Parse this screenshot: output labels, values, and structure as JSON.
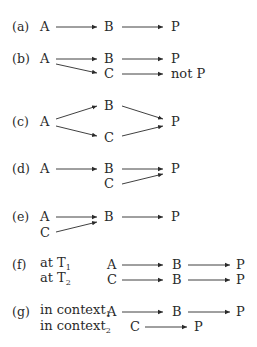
{
  "diagram": {
    "rows": [
      {
        "label": "(a)",
        "nodes": {
          "A": "A",
          "B": "B",
          "P": "P"
        }
      },
      {
        "label": "(b)",
        "nodes": {
          "A": "A",
          "B": "B",
          "P": "P",
          "C": "C",
          "notP": "not P"
        }
      },
      {
        "label": "(c)",
        "nodes": {
          "A": "A",
          "B": "B",
          "C": "C",
          "P": "P"
        }
      },
      {
        "label": "(d)",
        "nodes": {
          "A": "A",
          "B": "B",
          "C": "C",
          "P": "P"
        }
      },
      {
        "label": "(e)",
        "nodes": {
          "A": "A",
          "C": "C",
          "B": "B",
          "P": "P"
        }
      },
      {
        "label": "(f)",
        "sublabels": [
          {
            "text": "at T",
            "sub": "1"
          },
          {
            "text": "at T",
            "sub": "2"
          }
        ],
        "lines": [
          {
            "start": "A",
            "mid": "B",
            "end": "P"
          },
          {
            "start": "C",
            "mid": "B",
            "end": "P"
          }
        ]
      },
      {
        "label": "(g)",
        "sublabels": [
          {
            "text": "in context",
            "sub": "1"
          },
          {
            "text": "in context",
            "sub": "2"
          }
        ],
        "lines": [
          {
            "start": "A",
            "mid": "B",
            "end": "P"
          },
          {
            "start": "C",
            "end": "P"
          }
        ]
      }
    ]
  },
  "colors": {
    "ink": "#2a2a2a"
  }
}
